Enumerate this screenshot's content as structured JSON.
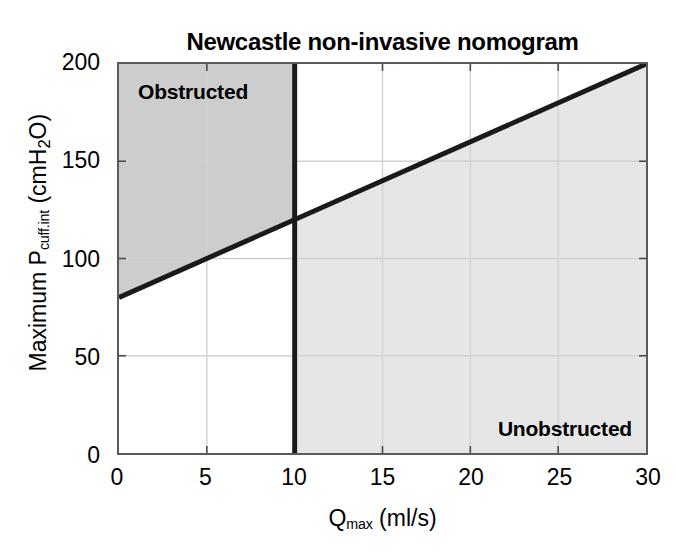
{
  "chart_data": {
    "type": "line",
    "title": "Newcastle non-invasive nomogram",
    "xlabel_prefix": "Q",
    "xlabel_sub": "max",
    "xlabel_suffix": " (ml/s)",
    "xlabel_full": "Qmax (ml/s)",
    "ylabel_prefix": "Maximum P",
    "ylabel_sub": "cuff.int",
    "ylabel_suffix": " (cmH",
    "ylabel_sub2": "2",
    "ylabel_suffix2": "O)",
    "ylabel_full": "Maximum Pcuff.int (cmH2O)",
    "xlim": [
      0,
      30
    ],
    "ylim": [
      0,
      200
    ],
    "xticks": [
      "0",
      "5",
      "10",
      "15",
      "20",
      "25",
      "30"
    ],
    "xtick_values": [
      0,
      5,
      10,
      15,
      20,
      25,
      30
    ],
    "yticks": [
      "0",
      "50",
      "100",
      "150",
      "200"
    ],
    "ytick_values": [
      0,
      50,
      100,
      150,
      200
    ],
    "grid": true,
    "legend": "none",
    "series": [
      {
        "name": "nomogram-diagonal-boundary",
        "type": "line",
        "x": [
          0,
          30
        ],
        "values": [
          80,
          200
        ],
        "slope": 4,
        "intercept": 80,
        "color": "#1a1a1a",
        "width": 4
      },
      {
        "name": "flow-threshold-vertical",
        "type": "vline",
        "x": [
          10,
          10
        ],
        "values": [
          0,
          200
        ],
        "color": "#1a1a1a",
        "width": 4
      }
    ],
    "regions": [
      {
        "name": "obstructed",
        "label": "Obstructed",
        "description": "x < 10 and y above diagonal line",
        "fill": "#cdcdcd"
      },
      {
        "name": "unobstructed",
        "label": "Unobstructed",
        "description": "x > 10 and y below diagonal line",
        "fill": "#e6e6e6"
      }
    ],
    "annotations": [
      {
        "text": "Obstructed",
        "x": 1.1,
        "y": 190
      },
      {
        "text": "Unobstructed",
        "x": 28.5,
        "y": 10
      }
    ],
    "colors": {
      "axis": "#5a5a5a",
      "grid": "#d4d4d4",
      "line": "#1a1a1a",
      "obstructed_fill": "#cdcdcd",
      "unobstructed_fill": "#e6e6e6",
      "background": "#ffffff",
      "text": "#000000"
    }
  },
  "figure": {
    "title": "Newcastle non-invasive nomogram",
    "region_obstructed_label": "Obstructed",
    "region_unobstructed_label": "Unobstructed"
  },
  "yaxis": {
    "title_prefix": "Maximum P",
    "title_sub": "cuff.int",
    "title_mid": " (cmH",
    "title_sub2": "2",
    "title_end": "O)",
    "ticks": [
      {
        "label": "200",
        "value": 200
      },
      {
        "label": "150",
        "value": 150
      },
      {
        "label": "100",
        "value": 100
      },
      {
        "label": "50",
        "value": 50
      },
      {
        "label": "0",
        "value": 0
      }
    ]
  },
  "xaxis": {
    "title_prefix": "Q",
    "title_sub": "max",
    "title_end": " (ml/s)",
    "ticks": [
      {
        "label": "0",
        "value": 0
      },
      {
        "label": "5",
        "value": 5
      },
      {
        "label": "10",
        "value": 10
      },
      {
        "label": "15",
        "value": 15
      },
      {
        "label": "20",
        "value": 20
      },
      {
        "label": "25",
        "value": 25
      },
      {
        "label": "30",
        "value": 30
      }
    ]
  }
}
